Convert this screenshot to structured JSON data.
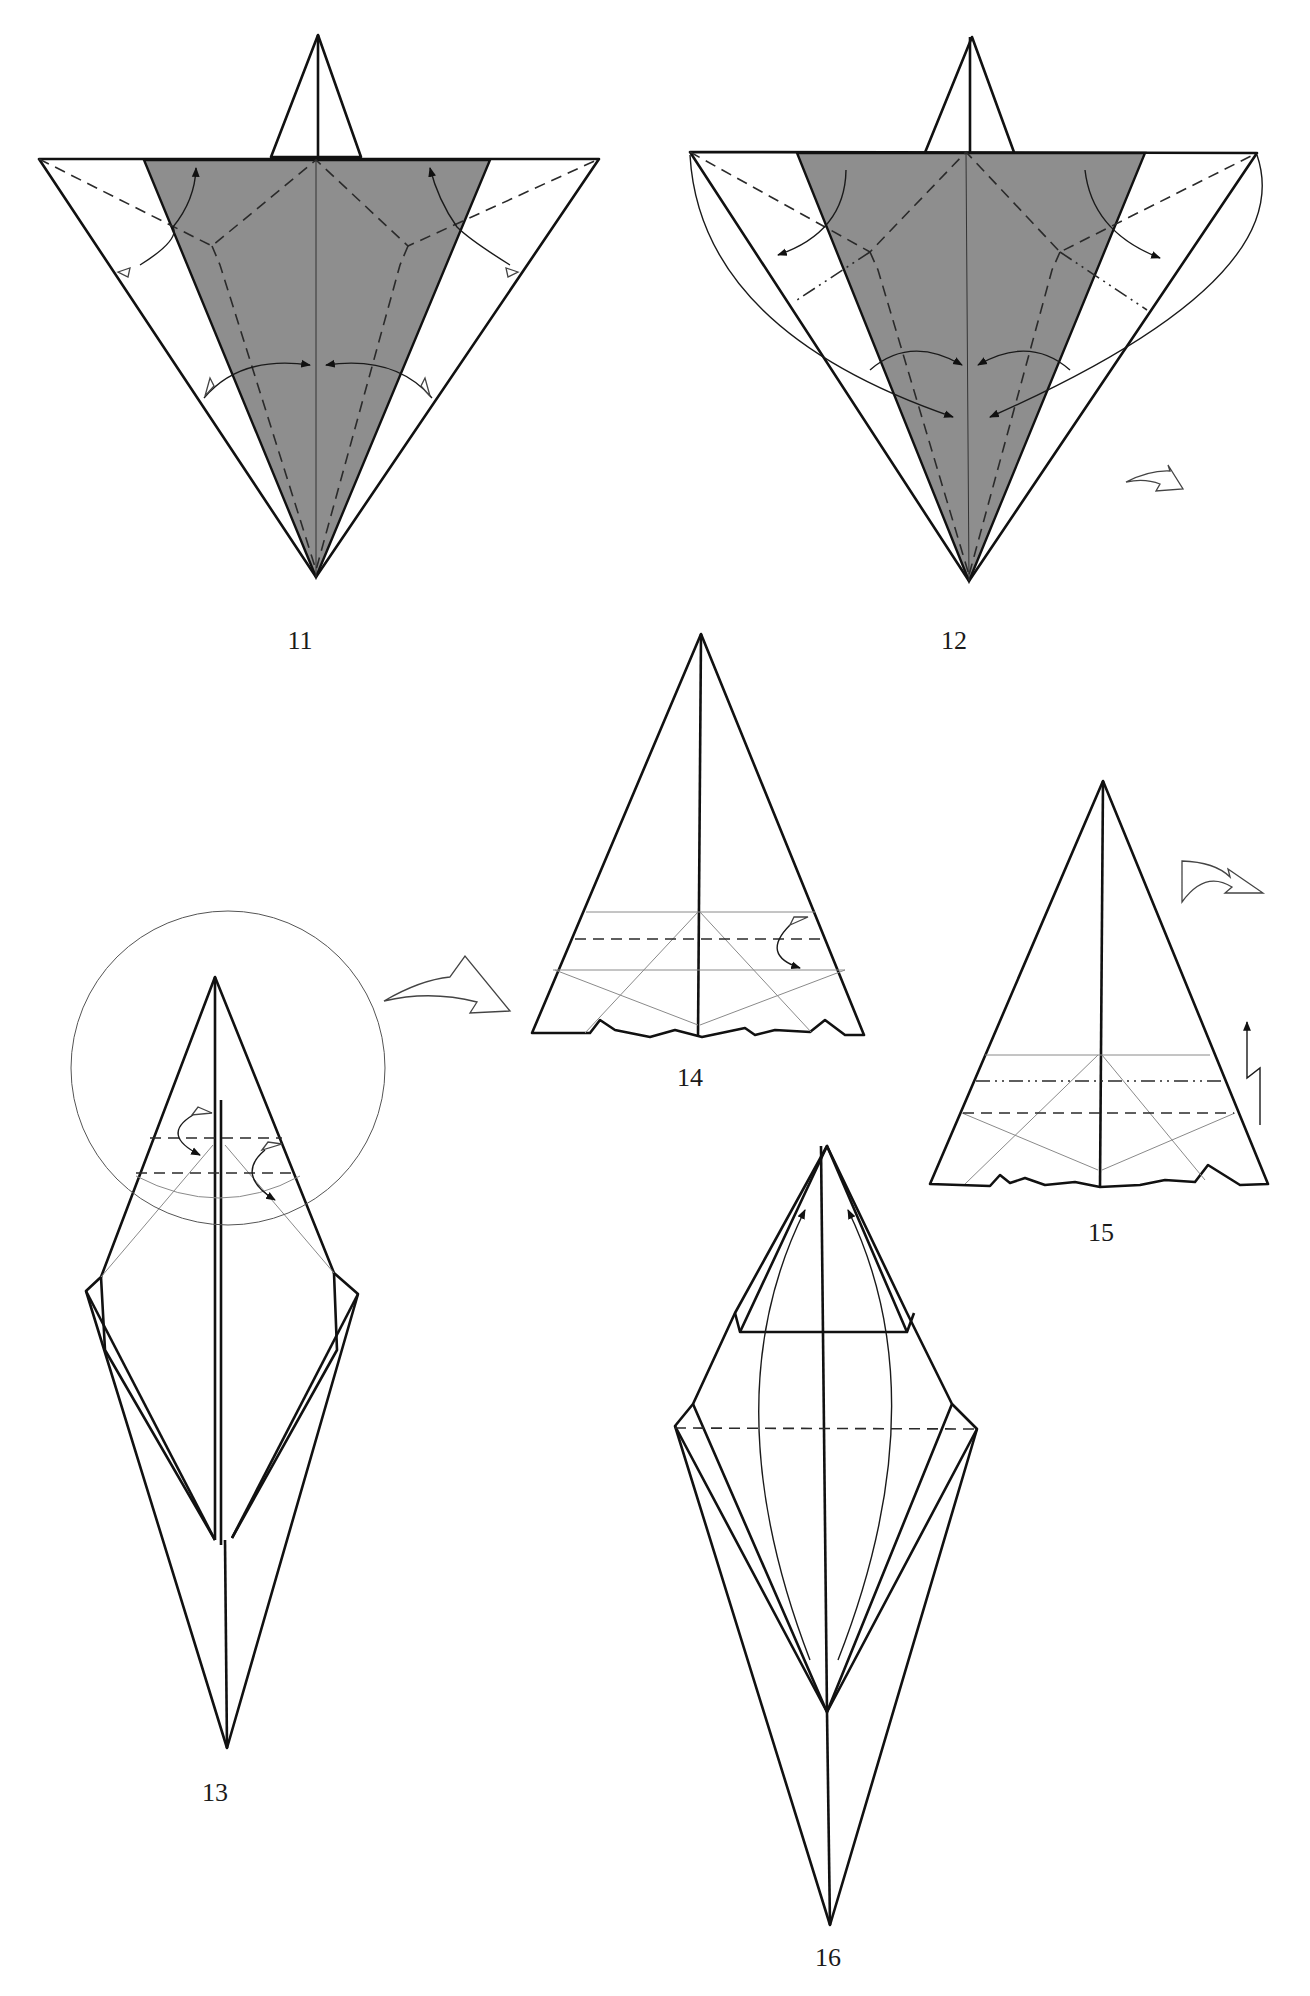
{
  "page": {
    "colors": {
      "background": "#ffffff",
      "paper_dark": "#8e8e8e",
      "paper_mid": "#b5b5b5",
      "paper_light": "#d6d6d6",
      "line": "#111111"
    }
  },
  "steps": [
    {
      "number": "11",
      "symbols": [
        "valley-fold",
        "squash-fold",
        "hollow-arrow",
        "fold-arrow"
      ]
    },
    {
      "number": "12",
      "symbols": [
        "valley-fold",
        "mountain-fold",
        "fold-arrow",
        "turn-over-arrow"
      ]
    },
    {
      "number": "13",
      "symbols": [
        "valley-fold",
        "pleat",
        "zoom-circle",
        "zoom-arrow"
      ]
    },
    {
      "number": "14",
      "symbols": [
        "valley-fold",
        "fold-arrow"
      ]
    },
    {
      "number": "15",
      "symbols": [
        "valley-fold",
        "mountain-fold",
        "pleat-arrow",
        "turn-over-arrow"
      ]
    },
    {
      "number": "16",
      "symbols": [
        "valley-fold",
        "fold-arrow"
      ]
    }
  ]
}
